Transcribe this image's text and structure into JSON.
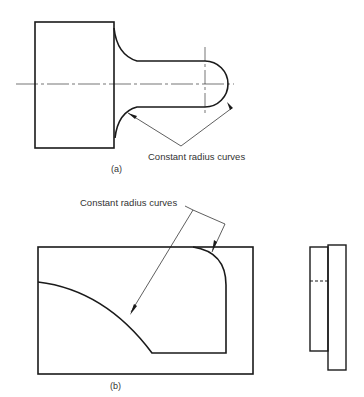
{
  "figure_a": {
    "caption": "(a)",
    "label": "Constant radius curves"
  },
  "figure_b": {
    "caption": "(b)",
    "label": "Constant radius curves"
  },
  "colors": {
    "line": "#1a1a1a",
    "text": "#333333",
    "background": "#ffffff"
  }
}
